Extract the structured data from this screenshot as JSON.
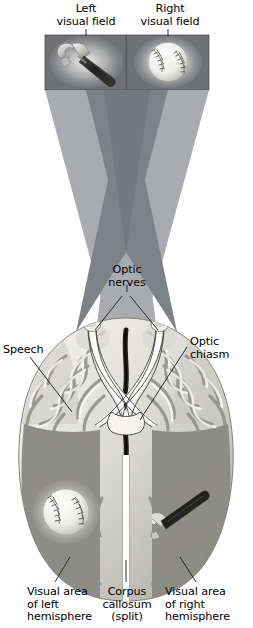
{
  "figure": {
    "type": "anatomical-diagram"
  },
  "labels": {
    "left_visual_field": "Left\nvisual field",
    "right_visual_field": "Right\nvisual field",
    "optic_nerves": "Optic\nnerves",
    "optic_chiasm": "Optic\nchiasm",
    "speech": "Speech",
    "visual_area_left": "Visual area\nof left\nhemisphere",
    "corpus_callosum": "Corpus\ncallosum\n(split)",
    "visual_area_right": "Visual area\nof right\nhemisphere"
  },
  "stimuli": {
    "left_panel_object": "hammer",
    "right_panel_object": "baseball",
    "left_hemisphere_object": "baseball",
    "right_hemisphere_object": "hammer"
  },
  "colors": {
    "panel_background": "#6f7175",
    "cone_outer": "#a9abae",
    "cone_inner": "#7e8185",
    "brain_light": "#e9e8e4",
    "brain_mid": "#b9b8b3",
    "brain_shadow": "#8e8d89",
    "visual_area_shade": "#8a8985",
    "text": "#000000",
    "leader_line": "#1a1a1a",
    "callosum": "#ffffff",
    "midline_dark": "#22211f"
  }
}
